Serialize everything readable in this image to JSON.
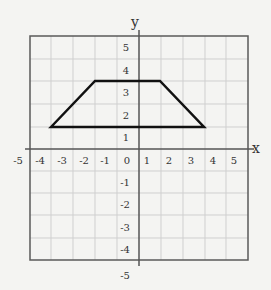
{
  "graph": {
    "axis_labels": {
      "x": "x",
      "y": "y"
    },
    "x_tick_labels": [
      "-5",
      "-4",
      "-3",
      "-2",
      "-1",
      "0",
      "1",
      "2",
      "3",
      "4",
      "5"
    ],
    "y_tick_labels_pos": [
      "5",
      "4",
      "3",
      "2",
      "1"
    ],
    "y_tick_labels_neg": [
      "-1",
      "-2",
      "-3",
      "-4",
      "-5"
    ],
    "shape": {
      "type": "trapezoid",
      "vertices": [
        [
          -3.5,
          1.5
        ],
        [
          -1.5,
          3.5
        ],
        [
          1.5,
          3.5
        ],
        [
          3.5,
          1.5
        ]
      ]
    },
    "colors": {
      "grid": "#c8c8c8",
      "frame": "#555555",
      "shape": "#111111"
    }
  }
}
